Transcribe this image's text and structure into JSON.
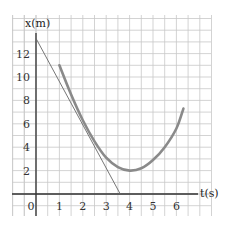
{
  "chart_data": {
    "type": "line",
    "title": "",
    "xlabel": "t(s)",
    "ylabel": "x(m)",
    "xlim": [
      -1,
      7.3
    ],
    "ylim": [
      -2,
      15
    ],
    "xticks": [
      "0",
      "1",
      "2",
      "3",
      "4",
      "5",
      "6"
    ],
    "yticks": [
      "2",
      "4",
      "6",
      "8",
      "10",
      "12"
    ],
    "grid": true,
    "series": [
      {
        "name": "curve",
        "type": "curve",
        "color": "#8a8a8a",
        "x": [
          1,
          1.5,
          2,
          2.5,
          3,
          3.5,
          4,
          4.5,
          5,
          5.5,
          6,
          6.3
        ],
        "y": [
          11,
          8.5,
          6.3,
          4.5,
          3.1,
          2.3,
          2.0,
          2.2,
          2.9,
          4.0,
          5.6,
          7.3
        ]
      },
      {
        "name": "tangent",
        "type": "line",
        "color": "#666666",
        "x": [
          0,
          3.6
        ],
        "y": [
          13.3,
          0
        ]
      }
    ]
  },
  "labels": {
    "ylabel": "x(m)",
    "xlabel": "t(s)",
    "origin": "0"
  }
}
